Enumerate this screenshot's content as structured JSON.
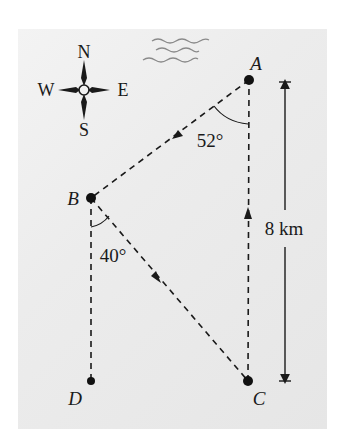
{
  "figure": {
    "type": "navigation-diagram",
    "colors": {
      "background": "#ffffff",
      "panel": "#ececec",
      "ink": "#1a1a1a",
      "waves": "#8a8a8a"
    }
  },
  "compass": {
    "north": "N",
    "south": "S",
    "east": "E",
    "west": "W"
  },
  "points": {
    "A": {
      "label": "A",
      "x": 249,
      "y": 80
    },
    "B": {
      "label": "B",
      "x": 91,
      "y": 198
    },
    "C": {
      "label": "C",
      "x": 248,
      "y": 381
    },
    "D": {
      "label": "D",
      "x": 91,
      "y": 381
    }
  },
  "angles": {
    "at_A": "52°",
    "at_B": "40°"
  },
  "distance": {
    "label": "8 km",
    "from": "A",
    "to": "C"
  },
  "paths": [
    {
      "from": "A",
      "to": "B",
      "style": "dashed",
      "arrow": "toward B"
    },
    {
      "from": "B",
      "to": "C",
      "style": "dashed",
      "arrow": "toward C"
    },
    {
      "from": "C",
      "to": "A",
      "style": "dashed",
      "arrow": "toward A"
    },
    {
      "from": "B",
      "to": "D",
      "style": "dashed",
      "arrow": "none"
    }
  ],
  "decorations": [
    "waves-icon"
  ]
}
